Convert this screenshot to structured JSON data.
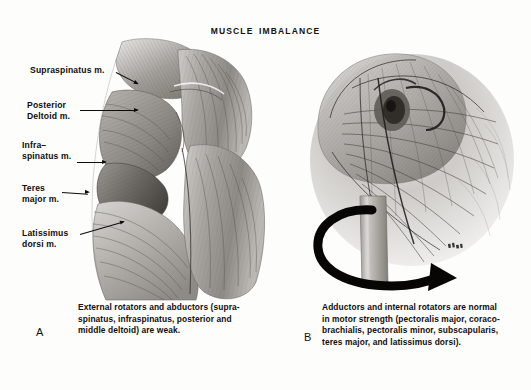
{
  "figure": {
    "title": "MUSCLE  IMBALANCE",
    "background_color": "#fdfdfc",
    "ink_color": "#110e0d",
    "medium": "grayscale anatomical pencil/wash illustration"
  },
  "panels": [
    {
      "letter": "A",
      "subject": "Posterior view of shoulder and scapular musculature",
      "caption": "External rotators and abductors (supra-\nspinatus, infraspinatus, posterior and\nmiddle deltoid) are weak.",
      "labels": [
        {
          "id": "supraspinatus",
          "text": "Supraspinatus m."
        },
        {
          "id": "posterior-deltoid",
          "text": "Posterior\nDeltoid m."
        },
        {
          "id": "infraspinatus",
          "text": "Infra–\nspinatus m."
        },
        {
          "id": "teres-major",
          "text": "Teres\nmajor m."
        },
        {
          "id": "latissimus-dorsi",
          "text": "Latissimus\ndorsi m."
        }
      ]
    },
    {
      "letter": "B",
      "subject": "Anterior view of shoulder with internal rotation arrow about the humerus",
      "caption": "Adductors and internal rotators are normal\nin motor strength (pectoralis major, coraco-\nbrachialis, pectoralis minor, subscapularis,\nteres major, and latissimus dorsi).",
      "labels": [],
      "arrow": {
        "id": "internal-rotation-arrow",
        "description": "bold curved arrow sweeping around humeral shaft, pointing right",
        "color": "#070605"
      }
    }
  ]
}
